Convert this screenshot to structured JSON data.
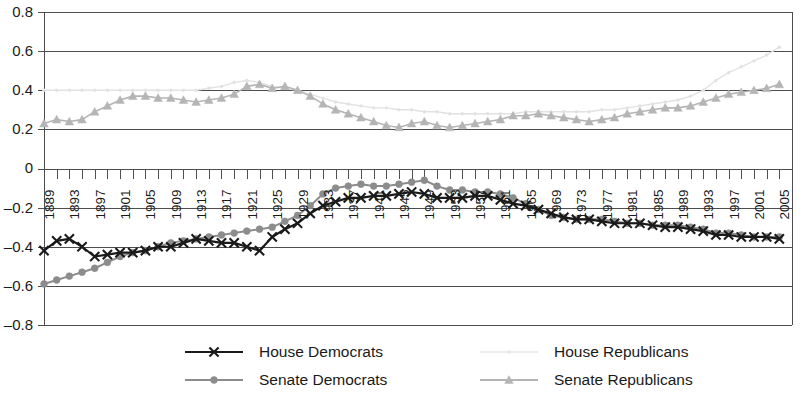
{
  "chart_data": {
    "type": "line",
    "title": "",
    "xlabel": "",
    "ylabel": "",
    "ylim": [
      -0.8,
      0.8
    ],
    "xlim": [
      1889,
      2007
    ],
    "grid": true,
    "legend_position": "bottom",
    "ytick_labels": [
      "0.8",
      "0.6",
      "0.4",
      "0.2",
      "0",
      "–0.2",
      "–0.4",
      "–0.6",
      "–0.8"
    ],
    "ytick_values": [
      0.8,
      0.6,
      0.4,
      0.2,
      0,
      -0.2,
      -0.4,
      -0.6,
      -0.8
    ],
    "xtick_labels": [
      "1889",
      "1893",
      "1897",
      "1901",
      "1905",
      "1909",
      "1913",
      "1917",
      "1921",
      "1925",
      "1929",
      "1933",
      "1937",
      "1941",
      "1945",
      "1949",
      "1953",
      "1957",
      "1961",
      "1965",
      "1969",
      "1973",
      "1977",
      "1981",
      "1985",
      "1989",
      "1993",
      "1997",
      "2001",
      "2005"
    ],
    "xtick_values": [
      1889,
      1893,
      1897,
      1901,
      1905,
      1909,
      1913,
      1917,
      1921,
      1925,
      1929,
      1933,
      1937,
      1941,
      1945,
      1949,
      1953,
      1957,
      1961,
      1965,
      1969,
      1973,
      1977,
      1981,
      1985,
      1989,
      1993,
      1997,
      2001,
      2005
    ],
    "x": [
      1889,
      1891,
      1893,
      1895,
      1897,
      1899,
      1901,
      1903,
      1905,
      1907,
      1909,
      1911,
      1913,
      1915,
      1917,
      1919,
      1921,
      1923,
      1925,
      1927,
      1929,
      1931,
      1933,
      1935,
      1937,
      1939,
      1941,
      1943,
      1945,
      1947,
      1949,
      1951,
      1953,
      1955,
      1957,
      1959,
      1961,
      1963,
      1965,
      1967,
      1969,
      1971,
      1973,
      1975,
      1977,
      1979,
      1981,
      1983,
      1985,
      1987,
      1989,
      1991,
      1993,
      1995,
      1997,
      1999,
      2001,
      2003,
      2005
    ],
    "series": [
      {
        "name": "House Democrats",
        "color": "#1a1a1a",
        "marker": "x",
        "linewidth": 2.2,
        "values": [
          -0.42,
          -0.37,
          -0.36,
          -0.4,
          -0.45,
          -0.44,
          -0.43,
          -0.43,
          -0.42,
          -0.4,
          -0.4,
          -0.38,
          -0.36,
          -0.37,
          -0.38,
          -0.38,
          -0.4,
          -0.42,
          -0.35,
          -0.31,
          -0.28,
          -0.23,
          -0.19,
          -0.17,
          -0.15,
          -0.15,
          -0.14,
          -0.14,
          -0.13,
          -0.12,
          -0.13,
          -0.15,
          -0.15,
          -0.15,
          -0.14,
          -0.14,
          -0.16,
          -0.18,
          -0.19,
          -0.21,
          -0.23,
          -0.25,
          -0.26,
          -0.26,
          -0.27,
          -0.28,
          -0.28,
          -0.28,
          -0.29,
          -0.3,
          -0.3,
          -0.31,
          -0.32,
          -0.34,
          -0.34,
          -0.35,
          -0.35,
          -0.35,
          -0.36
        ]
      },
      {
        "name": "Senate Democrats",
        "color": "#8c8c8c",
        "marker": "circle",
        "linewidth": 2.0,
        "values": [
          -0.59,
          -0.57,
          -0.55,
          -0.53,
          -0.51,
          -0.48,
          -0.45,
          -0.43,
          -0.42,
          -0.4,
          -0.38,
          -0.37,
          -0.36,
          -0.35,
          -0.34,
          -0.33,
          -0.32,
          -0.31,
          -0.3,
          -0.27,
          -0.24,
          -0.19,
          -0.13,
          -0.1,
          -0.09,
          -0.08,
          -0.09,
          -0.09,
          -0.08,
          -0.07,
          -0.06,
          -0.09,
          -0.11,
          -0.11,
          -0.12,
          -0.12,
          -0.13,
          -0.15,
          -0.18,
          -0.21,
          -0.24,
          -0.25,
          -0.26,
          -0.26,
          -0.26,
          -0.27,
          -0.28,
          -0.28,
          -0.29,
          -0.29,
          -0.29,
          -0.3,
          -0.31,
          -0.33,
          -0.33,
          -0.34,
          -0.35,
          -0.35,
          -0.35
        ]
      },
      {
        "name": "House Republicans",
        "color": "#e2e2e2",
        "marker": "dot",
        "linewidth": 1.4,
        "values": [
          0.4,
          0.4,
          0.4,
          0.4,
          0.4,
          0.4,
          0.4,
          0.4,
          0.4,
          0.4,
          0.4,
          0.4,
          0.4,
          0.41,
          0.42,
          0.44,
          0.45,
          0.44,
          0.42,
          0.41,
          0.4,
          0.38,
          0.36,
          0.34,
          0.33,
          0.32,
          0.31,
          0.31,
          0.3,
          0.3,
          0.29,
          0.29,
          0.28,
          0.28,
          0.28,
          0.28,
          0.28,
          0.28,
          0.29,
          0.29,
          0.29,
          0.29,
          0.29,
          0.29,
          0.3,
          0.3,
          0.31,
          0.32,
          0.33,
          0.34,
          0.35,
          0.37,
          0.4,
          0.45,
          0.49,
          0.52,
          0.55,
          0.58,
          0.62
        ]
      },
      {
        "name": "Senate Republicans",
        "color": "#b5b5b5",
        "marker": "triangle",
        "linewidth": 1.6,
        "values": [
          0.23,
          0.25,
          0.24,
          0.25,
          0.29,
          0.32,
          0.35,
          0.37,
          0.37,
          0.36,
          0.36,
          0.35,
          0.34,
          0.35,
          0.36,
          0.38,
          0.42,
          0.43,
          0.41,
          0.42,
          0.4,
          0.37,
          0.33,
          0.3,
          0.28,
          0.26,
          0.24,
          0.22,
          0.21,
          0.23,
          0.24,
          0.22,
          0.21,
          0.22,
          0.23,
          0.24,
          0.25,
          0.27,
          0.27,
          0.28,
          0.27,
          0.26,
          0.25,
          0.24,
          0.25,
          0.26,
          0.28,
          0.29,
          0.3,
          0.31,
          0.31,
          0.32,
          0.34,
          0.36,
          0.38,
          0.39,
          0.4,
          0.41,
          0.43
        ]
      }
    ]
  },
  "legend": {
    "items": [
      {
        "label": "House Democrats",
        "color": "#1a1a1a",
        "marker": "x"
      },
      {
        "label": "House Republicans",
        "color": "#e6e6e6",
        "marker": "dot"
      },
      {
        "label": "Senate Democrats",
        "color": "#8c8c8c",
        "marker": "circle"
      },
      {
        "label": "Senate Republicans",
        "color": "#b5b5b5",
        "marker": "triangle"
      }
    ]
  }
}
